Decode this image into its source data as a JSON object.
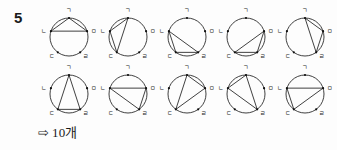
{
  "problem": {
    "number": "5"
  },
  "geometry": {
    "circle_radius": 19,
    "center_x": 29,
    "center_y": 29,
    "vertices": [
      {
        "id": "g",
        "label": "ㄱ",
        "angle_deg": -90,
        "label_dx": 0,
        "label_dy": -6.5,
        "anchor": "middle"
      },
      {
        "id": "n",
        "label": "ㄴ",
        "angle_deg": -162,
        "label_dx": -6.5,
        "label_dy": 2,
        "anchor": "middle"
      },
      {
        "id": "d",
        "label": "ㄷ",
        "angle_deg": 126,
        "label_dx": -6,
        "label_dy": 6,
        "anchor": "middle"
      },
      {
        "id": "r",
        "label": "ㄹ",
        "angle_deg": 54,
        "label_dx": 6,
        "label_dy": 6,
        "anchor": "middle"
      },
      {
        "id": "m",
        "label": "ㅁ",
        "angle_deg": -18,
        "label_dx": 6.5,
        "label_dy": 2,
        "anchor": "middle"
      }
    ]
  },
  "figures": {
    "rows": [
      {
        "cells": [
          {
            "name": "triangle-1",
            "vertices": [
              "g",
              "n",
              "m"
            ]
          },
          {
            "name": "triangle-2",
            "vertices": [
              "g",
              "n",
              "d"
            ]
          },
          {
            "name": "triangle-3",
            "vertices": [
              "n",
              "d",
              "r"
            ]
          },
          {
            "name": "triangle-4",
            "vertices": [
              "d",
              "r",
              "m"
            ]
          },
          {
            "name": "triangle-5",
            "vertices": [
              "g",
              "r",
              "m"
            ]
          }
        ]
      },
      {
        "cells": [
          {
            "name": "triangle-6",
            "vertices": [
              "g",
              "d",
              "r"
            ]
          },
          {
            "name": "triangle-7",
            "vertices": [
              "n",
              "r",
              "m"
            ]
          },
          {
            "name": "triangle-8",
            "vertices": [
              "g",
              "d",
              "m"
            ]
          },
          {
            "name": "triangle-9",
            "vertices": [
              "g",
              "n",
              "r"
            ]
          },
          {
            "name": "triangle-10",
            "vertices": [
              "n",
              "d",
              "m"
            ]
          }
        ]
      }
    ]
  },
  "answer": {
    "arrow": "⇨",
    "text": "10개"
  },
  "colors": {
    "background": "#fdfdfd",
    "ink": "#1a1a1a",
    "stroke": "#2b2b2b",
    "vertex_dot": "#111111"
  }
}
